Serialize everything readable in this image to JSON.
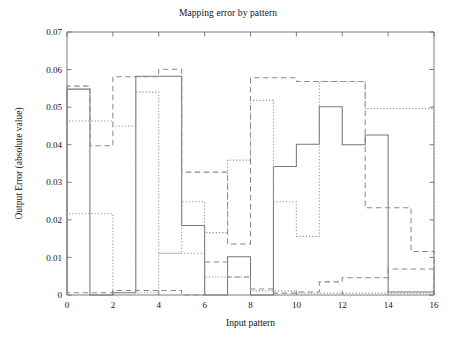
{
  "chart_data": {
    "type": "line",
    "title": "Mapping error by pattern",
    "xlabel": "Input pattern",
    "ylabel": "Output Error (absolute value)",
    "xlim": [
      0,
      16
    ],
    "ylim": [
      0,
      0.07
    ],
    "xticks": [
      0,
      2,
      4,
      6,
      8,
      10,
      12,
      14,
      16
    ],
    "xtick_labels": [
      "0",
      "2",
      "4",
      "6",
      "8",
      "10",
      "12",
      "14",
      "16"
    ],
    "yticks": [
      0,
      0.01,
      0.02,
      0.03,
      0.04,
      0.05,
      0.06,
      0.07
    ],
    "ytick_labels": [
      "0",
      "0.01",
      "0.02",
      "0.03",
      "0.04",
      "0.05",
      "0.06",
      "0.07"
    ],
    "grid": false,
    "legend": "none",
    "drawstyle": "steps-post",
    "categories": [
      1,
      2,
      3,
      4,
      5,
      6,
      7,
      8,
      9,
      10,
      11,
      12,
      13,
      14,
      15,
      16
    ],
    "series": [
      {
        "name": "solid",
        "linestyle": "solid",
        "color": "#777777",
        "values": [
          0.0548,
          0.0,
          0.0006,
          0.0582,
          0.0582,
          0.0185,
          0.0,
          0.0102,
          0.0,
          0.0342,
          0.0401,
          0.0501,
          0.04,
          0.0426,
          0.0008,
          0.0008
        ]
      },
      {
        "name": "dashed",
        "linestyle": "dashed",
        "color": "#8a8a8a",
        "values": [
          0.0556,
          0.0397,
          0.0581,
          0.0581,
          0.0601,
          0.0327,
          0.0327,
          0.0136,
          0.0578,
          0.0578,
          0.0568,
          0.0568,
          0.0568,
          0.0232,
          0.0232,
          0.0116
        ]
      },
      {
        "name": "dotted",
        "linestyle": "dotted",
        "color": "#9a9a9a",
        "values": [
          0.0463,
          0.0463,
          0.045,
          0.054,
          0.0111,
          0.0248,
          0.0166,
          0.0359,
          0.0518,
          0.0248,
          0.0156,
          0.0568,
          0.0568,
          0.0496,
          0.0496,
          0.0496
        ]
      },
      {
        "name": "dashed-low",
        "linestyle": "dashed",
        "color": "#8a8a8a",
        "values": [
          0.0006,
          0.0006,
          0.0012,
          0.0012,
          0.0012,
          0.0,
          0.0088,
          0.0048,
          0.0016,
          0.0005,
          0.0008,
          0.0035,
          0.0046,
          0.0046,
          0.0069,
          0.0069
        ]
      },
      {
        "name": "dotted-low",
        "linestyle": "dotted",
        "color": "#9a9a9a",
        "values": [
          0.0216,
          0.0216,
          0.0006,
          0.0006,
          0.0111,
          0.0111,
          0.0048,
          0.0048,
          0.0011,
          0.0011,
          0.0005,
          0.0005,
          0.0005,
          0.0005,
          0.0005,
          0.0005
        ]
      }
    ]
  },
  "axes": {
    "plot_left": 67,
    "plot_right": 434,
    "plot_top": 32,
    "plot_bottom": 295
  }
}
